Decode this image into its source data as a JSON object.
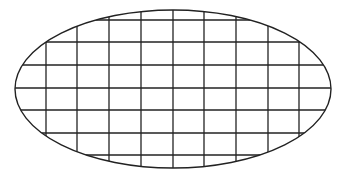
{
  "diagram": {
    "shape": "ellipse-with-grid",
    "ellipse": {
      "cx": 173,
      "cy": 89,
      "rx": 158,
      "ry": 79
    },
    "vertical_lines_x": [
      46,
      77,
      109,
      141,
      173,
      204,
      236,
      268,
      299
    ],
    "horizontal_lines_y": [
      20,
      42,
      65,
      88,
      110,
      133,
      155
    ],
    "stroke_color": "#222222",
    "background_color": "#ffffff"
  }
}
